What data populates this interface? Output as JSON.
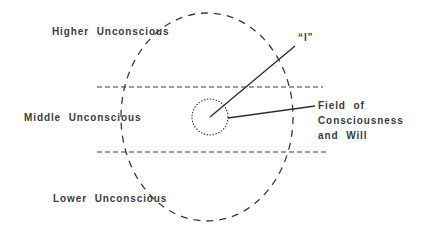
{
  "diagram": {
    "type": "egg-of-consciousness",
    "regions": {
      "higher": "Higher  Unconscious",
      "middle": "Middle  Unconscious",
      "lower": "Lower  Unconscious"
    },
    "self_label": "“I”",
    "field_label": {
      "line1": "Field  of",
      "line2": "Consciousness",
      "line3": "and  Will"
    },
    "colors": {
      "stroke": "#3a3a3a",
      "text": "#3b3b3b",
      "background": "#ffffff"
    }
  }
}
